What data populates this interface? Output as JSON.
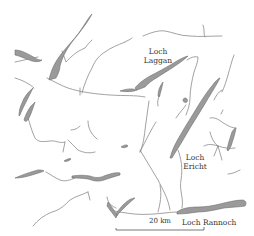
{
  "map": {
    "title": "",
    "colors": {
      "background": "#ffffff",
      "water": "#9a9a9a",
      "river": "#8a8a8a",
      "text": "#333333"
    },
    "labels": {
      "loch_laggan_line1": "Loch",
      "loch_laggan_line2": "Laggan",
      "loch_ericht_line1": "Loch",
      "loch_ericht_line2": "Ericht",
      "loch_rannoch": "Loch Rannoch"
    },
    "scale_bar": {
      "label": "20 km"
    }
  }
}
